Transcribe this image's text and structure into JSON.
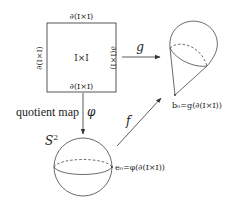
{
  "diagram": {
    "square": {
      "center_label": "I×I",
      "top_label": "∂(I×I)",
      "bottom_label": "∂(I×I)",
      "left_label": "∂(I×I)",
      "right_label": "∂(I×I)"
    },
    "arrows": {
      "g": {
        "label": "g"
      },
      "phi": {
        "label": "φ",
        "caption": "quotient map"
      },
      "f": {
        "label": "f"
      }
    },
    "sphere": {
      "label": "S",
      "superscript": "2",
      "point_label": "e₀=φ(∂(I×I))"
    },
    "teardrop": {
      "point_label": "b₀=g(∂(I×I))"
    },
    "colors": {
      "stroke": "#444444",
      "background": "#ffffff"
    }
  }
}
